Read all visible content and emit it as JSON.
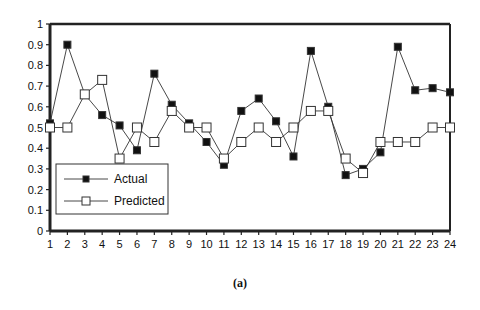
{
  "chart_data": {
    "type": "line",
    "title": "",
    "xlabel": "",
    "ylabel": "",
    "x": [
      1,
      2,
      3,
      4,
      5,
      6,
      7,
      8,
      9,
      10,
      11,
      12,
      13,
      14,
      15,
      16,
      17,
      18,
      19,
      20,
      21,
      22,
      23,
      24
    ],
    "ylim": [
      0,
      1
    ],
    "yticks": [
      0,
      0.1,
      0.2,
      0.3,
      0.4,
      0.5,
      0.6,
      0.7,
      0.8,
      0.9,
      1
    ],
    "ytick_labels": [
      "0",
      "0.1",
      "0.2",
      "0.3",
      "0.4",
      "0.5",
      "0.6",
      "0.7",
      "0.8",
      "0.9",
      "1"
    ],
    "grid": false,
    "legend_position": "lower-left inside",
    "series": [
      {
        "name": "Actual",
        "marker": "filled-square",
        "values": [
          0.52,
          0.9,
          0.66,
          0.56,
          0.51,
          0.39,
          0.76,
          0.61,
          0.52,
          0.43,
          0.32,
          0.58,
          0.64,
          0.53,
          0.36,
          0.87,
          0.6,
          0.27,
          0.3,
          0.38,
          0.89,
          0.68,
          0.69,
          0.67
        ]
      },
      {
        "name": "Predicted",
        "marker": "open-square",
        "values": [
          0.5,
          0.5,
          0.66,
          0.73,
          0.35,
          0.5,
          0.43,
          0.58,
          0.5,
          0.5,
          0.35,
          0.43,
          0.5,
          0.43,
          0.5,
          0.58,
          0.58,
          0.35,
          0.28,
          0.43,
          0.43,
          0.43,
          0.5,
          0.5
        ]
      }
    ],
    "caption": "(a)"
  }
}
